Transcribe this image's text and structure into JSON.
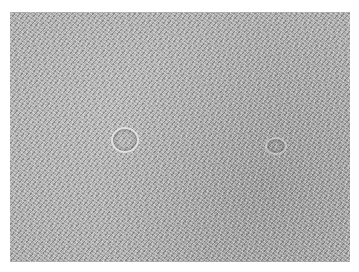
{
  "image": {
    "kind": "grayscale micrograph texture",
    "description": "Dense field of fine fibrous/spindle-like strands in gray tones with a small circular structure near center-left",
    "colors": {
      "base": "#a9a9a9",
      "light": "#e8e8e8",
      "dark": "#4a4a4a",
      "background": "#ffffff"
    }
  }
}
